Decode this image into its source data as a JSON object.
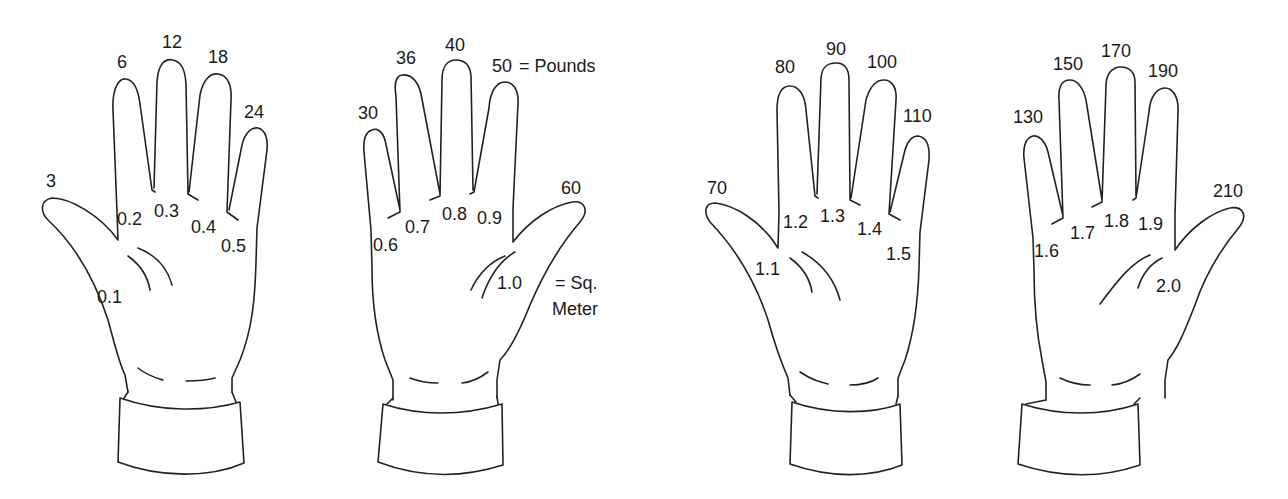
{
  "diagram": {
    "title": "",
    "units": {
      "pounds_label": "= Pounds",
      "sq_meter_label_line1": "= Sq.",
      "sq_meter_label_line2": "Meter"
    },
    "hands": [
      {
        "id": "hand-1",
        "orientation": "thumb-left",
        "pounds": [
          "3",
          "6",
          "12",
          "18",
          "24"
        ],
        "sq_meters": [
          "0.1",
          "0.2",
          "0.3",
          "0.4",
          "0.5"
        ]
      },
      {
        "id": "hand-2",
        "orientation": "thumb-right",
        "pounds": [
          "30",
          "36",
          "40",
          "50",
          "60"
        ],
        "sq_meters": [
          "0.6",
          "0.7",
          "0.8",
          "0.9",
          "1.0"
        ]
      },
      {
        "id": "hand-3",
        "orientation": "thumb-left",
        "pounds": [
          "70",
          "80",
          "90",
          "100",
          "110"
        ],
        "sq_meters": [
          "1.1",
          "1.2",
          "1.3",
          "1.4",
          "1.5"
        ]
      },
      {
        "id": "hand-4",
        "orientation": "thumb-right",
        "pounds": [
          "130",
          "150",
          "170",
          "190",
          "210"
        ],
        "sq_meters": [
          "1.6",
          "1.7",
          "1.8",
          "1.9",
          "2.0"
        ]
      }
    ]
  }
}
